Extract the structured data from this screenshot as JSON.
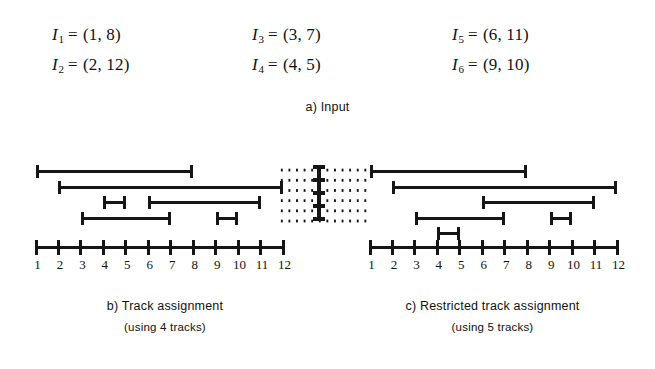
{
  "figure": {
    "ink_color": "#161616",
    "background": "#ffffff"
  },
  "part_a": {
    "caption": "a) Input",
    "columns": [
      {
        "rows": [
          {
            "name": "I",
            "sub": "1",
            "eq": "=",
            "pair": "(1, 8)"
          },
          {
            "name": "I",
            "sub": "2",
            "eq": "=",
            "pair": "(2, 12)"
          }
        ]
      },
      {
        "rows": [
          {
            "name": "I",
            "sub": "3",
            "eq": "=",
            "pair": "(3, 7)"
          },
          {
            "name": "I",
            "sub": "4",
            "eq": "=",
            "pair": "(4, 5)"
          }
        ]
      },
      {
        "rows": [
          {
            "name": "I",
            "sub": "5",
            "eq": "=",
            "pair": "(6, 11)"
          },
          {
            "name": "I",
            "sub": "6",
            "eq": "=",
            "pair": "(9, 10)"
          }
        ]
      }
    ]
  },
  "chart_data": {
    "type": "interval-track-diagram",
    "xlabel": "",
    "ylabel": "",
    "axis_ticks": [
      1,
      2,
      3,
      4,
      5,
      6,
      7,
      8,
      9,
      10,
      11,
      12
    ],
    "xlim": [
      1,
      12
    ],
    "intervals": [
      {
        "id": "I1",
        "start": 1,
        "end": 8
      },
      {
        "id": "I2",
        "start": 2,
        "end": 12
      },
      {
        "id": "I3",
        "start": 3,
        "end": 7
      },
      {
        "id": "I4",
        "start": 4,
        "end": 5
      },
      {
        "id": "I5",
        "start": 6,
        "end": 11
      },
      {
        "id": "I6",
        "start": 9,
        "end": 10
      }
    ],
    "panels": [
      {
        "key": "b",
        "caption_line1": "b) Track assignment",
        "caption_line2": "(using 4 tracks)",
        "track_count": 4,
        "tracks": [
          {
            "track": 1,
            "bars": [
              {
                "id": "I1",
                "start": 1,
                "end": 8
              }
            ]
          },
          {
            "track": 2,
            "bars": [
              {
                "id": "I2",
                "start": 2,
                "end": 12
              }
            ]
          },
          {
            "track": 3,
            "bars": [
              {
                "id": "I4",
                "start": 4,
                "end": 5
              },
              {
                "id": "I5",
                "start": 6,
                "end": 11
              }
            ]
          },
          {
            "track": 4,
            "bars": [
              {
                "id": "I3",
                "start": 3,
                "end": 7
              },
              {
                "id": "I6",
                "start": 9,
                "end": 10
              }
            ]
          }
        ]
      },
      {
        "key": "c",
        "caption_line1": "c) Restricted track assignment",
        "caption_line2": "(using 5 tracks)",
        "track_count": 5,
        "tracks": [
          {
            "track": 1,
            "bars": [
              {
                "id": "I1",
                "start": 1,
                "end": 8
              }
            ]
          },
          {
            "track": 2,
            "bars": [
              {
                "id": "I2",
                "start": 2,
                "end": 12
              }
            ]
          },
          {
            "track": 3,
            "bars": [
              {
                "id": "I5",
                "start": 6,
                "end": 11
              }
            ]
          },
          {
            "track": 4,
            "bars": [
              {
                "id": "I3",
                "start": 3,
                "end": 7
              },
              {
                "id": "I6",
                "start": 9,
                "end": 10
              }
            ]
          },
          {
            "track": 5,
            "bars": [
              {
                "id": "I4",
                "start": 4,
                "end": 5
              }
            ]
          }
        ]
      }
    ],
    "restricted_region": {
      "description": "dotted channel separating the two panels with a vertical barrier bar"
    }
  }
}
